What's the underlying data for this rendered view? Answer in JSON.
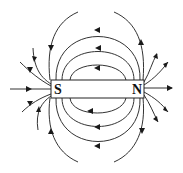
{
  "diagram": {
    "magnet": {
      "south_label": "S",
      "north_label": "N"
    },
    "colors": {
      "line": "#333333",
      "arrow": "#1a1a1a",
      "background": "#ffffff"
    }
  }
}
